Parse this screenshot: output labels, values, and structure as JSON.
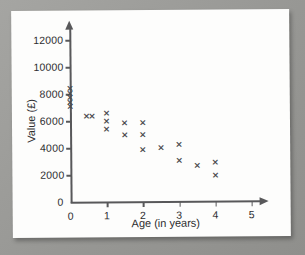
{
  "figure": {
    "medium": "printed-textbook-page-photo",
    "paper_color": "#fdfdfc",
    "backdrop_color": "#9e9e9b",
    "ink_color": "#2e2e30",
    "axis_color": "#58585a",
    "marker_color": "#4a4a4d"
  },
  "chart_data": {
    "type": "scatter",
    "title": "",
    "xlabel": "Age (in years)",
    "ylabel": "Value (£)",
    "xlim": [
      0,
      5.3
    ],
    "ylim": [
      0,
      13000
    ],
    "xticks": [
      0,
      1,
      2,
      3,
      4,
      5
    ],
    "xtick_labels": [
      "0",
      "1",
      "2",
      "3",
      "4",
      "5"
    ],
    "yticks": [
      0,
      2000,
      4000,
      6000,
      8000,
      10000,
      12000
    ],
    "ytick_labels": [
      "0",
      "2000",
      "4000",
      "6000",
      "8000",
      "10000",
      "12000"
    ],
    "grid": false,
    "legend": false,
    "marker": "x",
    "origin_label": "0",
    "points": [
      {
        "x": 0,
        "y": 8400
      },
      {
        "x": 0,
        "y": 8050
      },
      {
        "x": 0,
        "y": 7750
      },
      {
        "x": 0,
        "y": 7400
      },
      {
        "x": 0,
        "y": 7100
      },
      {
        "x": 0.45,
        "y": 6350
      },
      {
        "x": 0.6,
        "y": 6300
      },
      {
        "x": 1.0,
        "y": 6550
      },
      {
        "x": 1.0,
        "y": 5950
      },
      {
        "x": 1.0,
        "y": 5400
      },
      {
        "x": 1.5,
        "y": 5800
      },
      {
        "x": 1.5,
        "y": 4900
      },
      {
        "x": 2.0,
        "y": 5800
      },
      {
        "x": 2.0,
        "y": 4900
      },
      {
        "x": 2.0,
        "y": 3800
      },
      {
        "x": 2.5,
        "y": 3950
      },
      {
        "x": 3.0,
        "y": 4200
      },
      {
        "x": 3.0,
        "y": 3000
      },
      {
        "x": 3.5,
        "y": 2650
      },
      {
        "x": 4.0,
        "y": 2850
      },
      {
        "x": 4.0,
        "y": 1900
      }
    ]
  }
}
